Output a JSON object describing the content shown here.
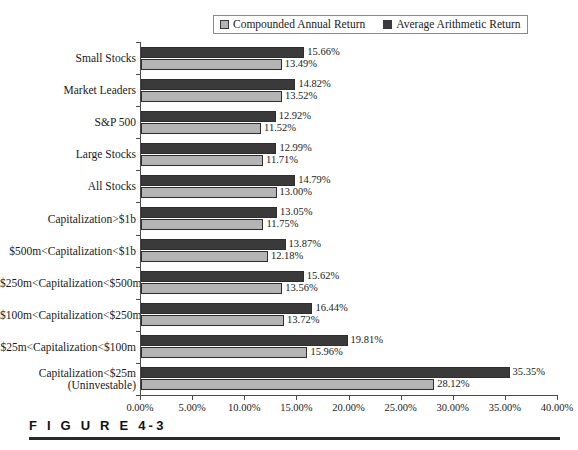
{
  "figure": {
    "caption": "F I G U R E  4-3"
  },
  "legend": {
    "position": "top-center",
    "entries": [
      {
        "label": "Compounded Annual Return",
        "swatch": "light",
        "color": "#b4b4b4"
      },
      {
        "label": "Average Arithmetic Return",
        "swatch": "dark",
        "color": "#3a3a3a"
      }
    ]
  },
  "chart_data": {
    "type": "bar",
    "orientation": "horizontal",
    "title": "",
    "xlabel": "",
    "ylabel": "",
    "xlim": [
      0,
      40
    ],
    "grid": false,
    "legend_position": "top-center",
    "xticks": [
      "0.00%",
      "5.00%",
      "10.00%",
      "15.00%",
      "20.00%",
      "25.00%",
      "30.00%",
      "35.00%",
      "40.00%"
    ],
    "xtick_values": [
      0,
      5,
      10,
      15,
      20,
      25,
      30,
      35,
      40
    ],
    "categories": [
      "Small Stocks",
      "Market Leaders",
      "S&P 500",
      "Large Stocks",
      "All Stocks",
      "Capitalization>$1b",
      "$500m<Capitalization<$1b",
      "$250m<Capitalization<$500m",
      "$100m<Capitalization<$250m",
      "$25m<Capitalization<$100m",
      "Capitalization<$25m (Uninvestable)"
    ],
    "category_lines": [
      [
        "Small Stocks"
      ],
      [
        "Market Leaders"
      ],
      [
        "S&P 500"
      ],
      [
        "Large Stocks"
      ],
      [
        "All Stocks"
      ],
      [
        "Capitalization>$1b"
      ],
      [
        "$500m<Capitalization<$1b"
      ],
      [
        "$250m<Capitalization<$500m"
      ],
      [
        "$100m<Capitalization<$250m"
      ],
      [
        "$25m<Capitalization<$100m"
      ],
      [
        "Capitalization<$25m",
        "(Uninvestable)"
      ]
    ],
    "series": [
      {
        "name": "Average Arithmetic Return",
        "color": "#3a3a3a",
        "values": [
          15.66,
          14.82,
          12.92,
          12.99,
          14.79,
          13.05,
          13.87,
          15.62,
          16.44,
          19.81,
          35.35
        ],
        "labels": [
          "15.66%",
          "14.82%",
          "12.92%",
          "12.99%",
          "14.79%",
          "13.05%",
          "13.87%",
          "15.62%",
          "16.44%",
          "19.81%",
          "35.35%"
        ]
      },
      {
        "name": "Compounded Annual Return",
        "color": "#b4b4b4",
        "values": [
          13.49,
          13.52,
          11.52,
          11.71,
          13.0,
          11.75,
          12.18,
          13.56,
          13.72,
          15.96,
          28.12
        ],
        "labels": [
          "13.49%",
          "13.52%",
          "11.52%",
          "11.71%",
          "13.00%",
          "11.75%",
          "12.18%",
          "13.56%",
          "13.72%",
          "15.96%",
          "28.12%"
        ]
      }
    ]
  }
}
